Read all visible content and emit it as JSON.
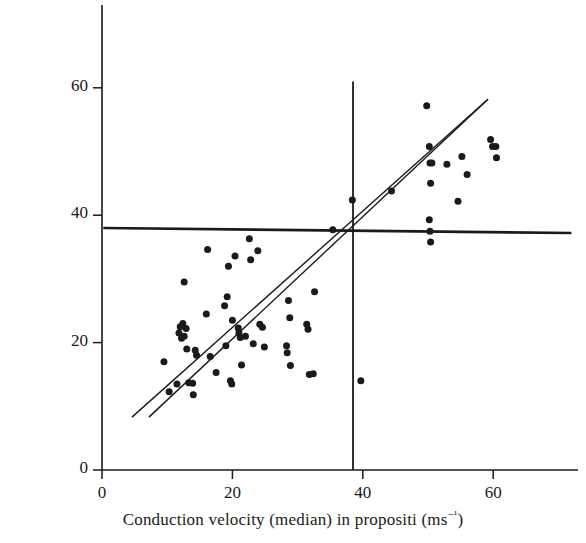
{
  "figure": {
    "background_color": "#ffffff",
    "ink_color": "#1a1a1a",
    "width": 586,
    "height": 543
  },
  "axes": {
    "x_title_prefix": "Conduction velocity (median) in propositi (ms",
    "x_title_sup": "−¹",
    "x_title_suffix": ")",
    "y_title_prefix": "Conduction velocity (median) in relatives (ms",
    "y_title_sup": "−¹",
    "y_title_suffix": ")",
    "x_ticks": [
      "0",
      "20",
      "40",
      "60"
    ],
    "y_ticks": [
      "0",
      "20",
      "40",
      "60"
    ]
  },
  "chart_data": {
    "type": "scatter",
    "title": "",
    "xlabel": "Conduction velocity (median) in propositi (ms⁻¹)",
    "ylabel": "Conduction velocity (median) in relatives (ms⁻¹)",
    "xlim": [
      0,
      73
    ],
    "ylim": [
      0,
      73
    ],
    "xticks": [
      0,
      20,
      40,
      60
    ],
    "yticks": [
      0,
      20,
      40,
      60
    ],
    "grid": false,
    "legend": null,
    "marker": "filled-circle",
    "marker_color": "#1a1a1a",
    "marker_size_px": 7,
    "points": [
      [
        9.5,
        17.0
      ],
      [
        10.3,
        12.3
      ],
      [
        11.5,
        13.5
      ],
      [
        11.8,
        21.5
      ],
      [
        12.0,
        22.5
      ],
      [
        12.2,
        20.7
      ],
      [
        12.4,
        23.0
      ],
      [
        12.6,
        21.0
      ],
      [
        12.9,
        22.2
      ],
      [
        12.6,
        29.5
      ],
      [
        13.0,
        19.0
      ],
      [
        13.3,
        13.7
      ],
      [
        13.9,
        13.6
      ],
      [
        14.0,
        11.8
      ],
      [
        14.3,
        18.8
      ],
      [
        14.5,
        18.0
      ],
      [
        16.0,
        24.5
      ],
      [
        16.2,
        34.6
      ],
      [
        16.6,
        17.8
      ],
      [
        17.5,
        15.3
      ],
      [
        18.8,
        25.8
      ],
      [
        19.0,
        19.5
      ],
      [
        19.2,
        27.2
      ],
      [
        19.4,
        32.0
      ],
      [
        19.7,
        14.0
      ],
      [
        19.9,
        13.5
      ],
      [
        20.0,
        23.5
      ],
      [
        20.4,
        33.6
      ],
      [
        20.9,
        22.3
      ],
      [
        21.0,
        21.5
      ],
      [
        21.2,
        20.8
      ],
      [
        21.4,
        16.5
      ],
      [
        22.0,
        21.0
      ],
      [
        22.6,
        36.3
      ],
      [
        22.8,
        33.0
      ],
      [
        23.2,
        19.8
      ],
      [
        23.9,
        34.4
      ],
      [
        24.2,
        22.9
      ],
      [
        24.6,
        22.4
      ],
      [
        24.9,
        19.3
      ],
      [
        28.3,
        19.5
      ],
      [
        28.4,
        18.4
      ],
      [
        28.6,
        26.6
      ],
      [
        28.8,
        23.9
      ],
      [
        28.9,
        16.4
      ],
      [
        31.4,
        22.9
      ],
      [
        31.6,
        22.1
      ],
      [
        31.8,
        15.0
      ],
      [
        32.4,
        15.1
      ],
      [
        32.6,
        28.0
      ],
      [
        35.4,
        37.7
      ],
      [
        38.4,
        42.4
      ],
      [
        39.7,
        14.0
      ],
      [
        44.4,
        43.8
      ],
      [
        49.8,
        57.2
      ],
      [
        50.2,
        50.8
      ],
      [
        50.3,
        48.2
      ],
      [
        50.6,
        48.2
      ],
      [
        50.4,
        45.0
      ],
      [
        50.2,
        39.3
      ],
      [
        50.3,
        37.5
      ],
      [
        50.4,
        35.8
      ],
      [
        52.9,
        48.0
      ],
      [
        54.6,
        42.2
      ],
      [
        55.2,
        49.2
      ],
      [
        56.0,
        46.4
      ],
      [
        59.6,
        51.9
      ],
      [
        59.9,
        50.8
      ],
      [
        60.4,
        50.8
      ],
      [
        60.5,
        49.0
      ]
    ],
    "lines": [
      {
        "name": "regression-line-upper",
        "x0": 4.6,
        "y0": 8.3,
        "x1": 59.2,
        "y1": 58.2,
        "width_px": 1.4
      },
      {
        "name": "regression-line-lower",
        "x0": 7.2,
        "y0": 8.3,
        "x1": 59.2,
        "y1": 58.2,
        "width_px": 1.4
      },
      {
        "name": "horizontal-mean-line",
        "x0": 0.2,
        "y0": 38.0,
        "x1": 72.0,
        "y1": 37.2,
        "width_px": 2.6
      },
      {
        "name": "vertical-mean-line",
        "x0": 38.5,
        "y0": 0.0,
        "x1": 38.5,
        "y1": 61.0,
        "width_px": 1.8
      }
    ]
  }
}
